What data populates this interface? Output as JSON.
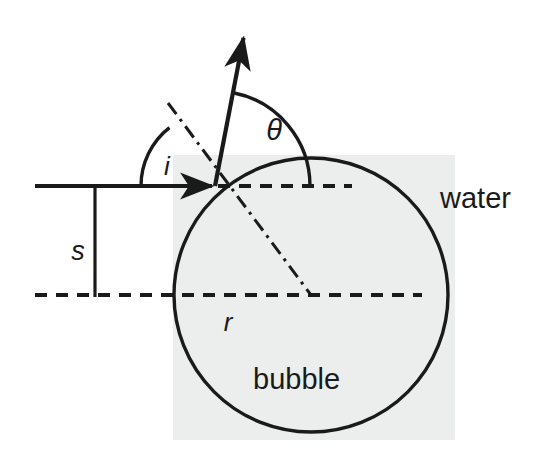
{
  "figure": {
    "type": "schematic-diagram",
    "canvas": {
      "width": 539,
      "height": 463
    },
    "colors": {
      "background": "#ffffff",
      "bubble_fill": "#eceded",
      "stroke": "#1a1a1a",
      "label": "#1a1a1a"
    }
  },
  "labels": {
    "angle_incidence": "i",
    "angle_theta": "θ",
    "impact_parameter": "s",
    "radius": "r",
    "medium_outer": "water",
    "medium_inner": "bubble"
  },
  "geometry": {
    "bubble": {
      "center_x": 311,
      "center_y": 295,
      "radius": 137,
      "label": "bubble"
    },
    "background_patch": {
      "x": 173,
      "y": 155,
      "width": 282,
      "height": 285
    },
    "hit_point": {
      "x": 215,
      "y": 186
    },
    "incoming_ray": {
      "from_x": 35,
      "from_y": 186,
      "to_x": 215,
      "to_y": 186,
      "style": "solid-with-arrowhead"
    },
    "outgoing_ray": {
      "from_x": 215,
      "from_y": 186,
      "to_x": 245,
      "to_y": 30,
      "style": "solid-with-arrowhead"
    },
    "normal_line": {
      "from_x": 168,
      "from_y": 103,
      "to_x": 311,
      "to_y": 295,
      "style": "dash-dot"
    },
    "upper_dashed_line": {
      "from_x": 218,
      "from_y": 186,
      "to_x": 352,
      "to_y": 186,
      "style": "dashed"
    },
    "lower_dashed_line": {
      "from_x": 35,
      "from_y": 295,
      "to_x": 422,
      "to_y": 295,
      "style": "dashed"
    },
    "impact_bracket": {
      "x": 95,
      "from_y": 186,
      "to_y": 297,
      "style": "solid"
    },
    "arc_i": {
      "center_x": 215,
      "center_y": 186,
      "radius": 74,
      "start_deg": 180,
      "end_deg": 233
    },
    "arc_theta": {
      "center_x": 215,
      "center_y": 186,
      "radius": 95,
      "start_deg": 280,
      "end_deg": 360
    }
  },
  "label_positions": {
    "i": {
      "x": 167,
      "y": 175,
      "size": 26
    },
    "theta": {
      "x": 274,
      "y": 140,
      "size": 29
    },
    "s": {
      "x": 78,
      "y": 260,
      "size": 27
    },
    "r": {
      "x": 228,
      "y": 331,
      "size": 26
    },
    "water": {
      "x": 440,
      "y": 208,
      "size": 29
    },
    "bubble": {
      "x": 253,
      "y": 389,
      "size": 29
    }
  }
}
